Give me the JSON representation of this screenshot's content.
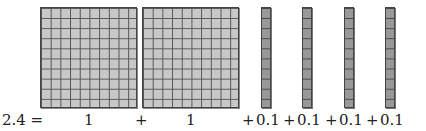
{
  "equation": {
    "lhs": "2.4 =",
    "terms": [
      {
        "label": "1",
        "type": "flat"
      },
      {
        "plus": "+",
        "label": "1",
        "type": "flat"
      },
      {
        "plus": "+",
        "label": "0.1",
        "type": "rod"
      },
      {
        "plus": "+",
        "label": "0.1",
        "type": "rod"
      },
      {
        "plus": "+",
        "label": "0.1",
        "type": "rod"
      },
      {
        "plus": "+",
        "label": "0.1",
        "type": "rod"
      }
    ]
  },
  "colors": {
    "flat_fill": "#c8c8c8",
    "rod_fill": "#999999",
    "grid_line": "#555555"
  }
}
